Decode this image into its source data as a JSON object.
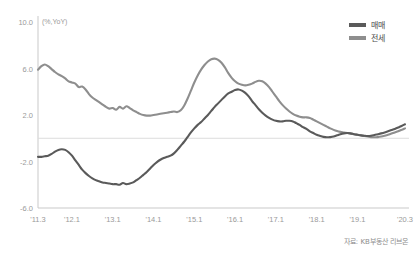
{
  "chart_data": {
    "type": "line",
    "title": "",
    "subtitle": "",
    "unit_label": "(%,YoY)",
    "xlabel": "",
    "ylabel": "",
    "ylim": [
      -6.0,
      10.0
    ],
    "ytick_values": [
      10.0,
      6.0,
      2.0,
      -2.0,
      -6.0
    ],
    "ytick_labels": [
      "10.0",
      "6.0",
      "2.0",
      "-2.0",
      "-6.0"
    ],
    "xtick_labels": [
      "'11.3",
      "'12.1",
      "'13.1",
      "'14.1",
      "'15.1",
      "'16.1",
      "'17.1",
      "'18.1",
      "'19.1",
      "'20.3"
    ],
    "xtick_positions": [
      0,
      10,
      22,
      34,
      46,
      58,
      70,
      82,
      94,
      108
    ],
    "x_count": 109,
    "x_start": "2011.3",
    "x_end": "2020.3",
    "grid": "zero-line-only",
    "zero_line": 0.0,
    "legend_position": "top-right",
    "source_note": "자료: KB부동산 리브온",
    "series": [
      {
        "name": "매매",
        "color": "#5a5a5a",
        "values": [
          -1.6,
          -1.6,
          -1.55,
          -1.5,
          -1.35,
          -1.15,
          -1.0,
          -0.95,
          -1.0,
          -1.2,
          -1.5,
          -1.9,
          -2.3,
          -2.7,
          -3.0,
          -3.25,
          -3.45,
          -3.6,
          -3.7,
          -3.8,
          -3.85,
          -3.9,
          -3.95,
          -3.95,
          -4.0,
          -3.85,
          -3.95,
          -3.9,
          -3.8,
          -3.6,
          -3.4,
          -3.15,
          -2.9,
          -2.6,
          -2.3,
          -2.05,
          -1.85,
          -1.7,
          -1.6,
          -1.5,
          -1.3,
          -1.0,
          -0.65,
          -0.3,
          0.1,
          0.5,
          0.85,
          1.15,
          1.4,
          1.7,
          2.0,
          2.35,
          2.7,
          3.0,
          3.3,
          3.6,
          3.85,
          4.0,
          4.15,
          4.2,
          4.1,
          3.9,
          3.6,
          3.2,
          2.85,
          2.5,
          2.2,
          1.95,
          1.75,
          1.6,
          1.5,
          1.45,
          1.45,
          1.5,
          1.5,
          1.45,
          1.3,
          1.15,
          0.95,
          0.8,
          0.6,
          0.45,
          0.3,
          0.2,
          0.12,
          0.08,
          0.1,
          0.15,
          0.25,
          0.35,
          0.42,
          0.45,
          0.42,
          0.35,
          0.3,
          0.25,
          0.22,
          0.2,
          0.22,
          0.28,
          0.35,
          0.42,
          0.5,
          0.6,
          0.7,
          0.8,
          0.92,
          1.05,
          1.2
        ]
      },
      {
        "name": "전세",
        "color": "#8e8e8e",
        "values": [
          5.9,
          6.2,
          6.35,
          6.2,
          5.95,
          5.7,
          5.5,
          5.35,
          5.15,
          4.9,
          4.8,
          4.7,
          4.4,
          4.45,
          4.2,
          3.8,
          3.5,
          3.3,
          3.1,
          2.9,
          2.7,
          2.55,
          2.6,
          2.45,
          2.7,
          2.55,
          2.75,
          2.6,
          2.4,
          2.25,
          2.1,
          2.0,
          1.95,
          1.95,
          2.0,
          2.05,
          2.1,
          2.15,
          2.2,
          2.25,
          2.3,
          2.25,
          2.4,
          2.8,
          3.4,
          4.1,
          4.8,
          5.4,
          5.9,
          6.3,
          6.6,
          6.8,
          6.85,
          6.75,
          6.5,
          6.1,
          5.6,
          5.2,
          4.9,
          4.7,
          4.6,
          4.55,
          4.6,
          4.7,
          4.85,
          4.95,
          4.9,
          4.7,
          4.4,
          4.0,
          3.6,
          3.2,
          2.85,
          2.55,
          2.3,
          2.1,
          1.95,
          1.85,
          1.8,
          1.8,
          1.75,
          1.6,
          1.45,
          1.3,
          1.15,
          1.0,
          0.85,
          0.72,
          0.62,
          0.55,
          0.5,
          0.45,
          0.4,
          0.35,
          0.3,
          0.25,
          0.2,
          0.15,
          0.1,
          0.08,
          0.1,
          0.15,
          0.22,
          0.3,
          0.4,
          0.5,
          0.6,
          0.72,
          0.85
        ]
      }
    ]
  },
  "legend": {
    "items": [
      {
        "label": "매매",
        "color": "#5a5a5a"
      },
      {
        "label": "전세",
        "color": "#8e8e8e"
      }
    ]
  },
  "source": {
    "text": "자료: KB부동산 리브온"
  }
}
